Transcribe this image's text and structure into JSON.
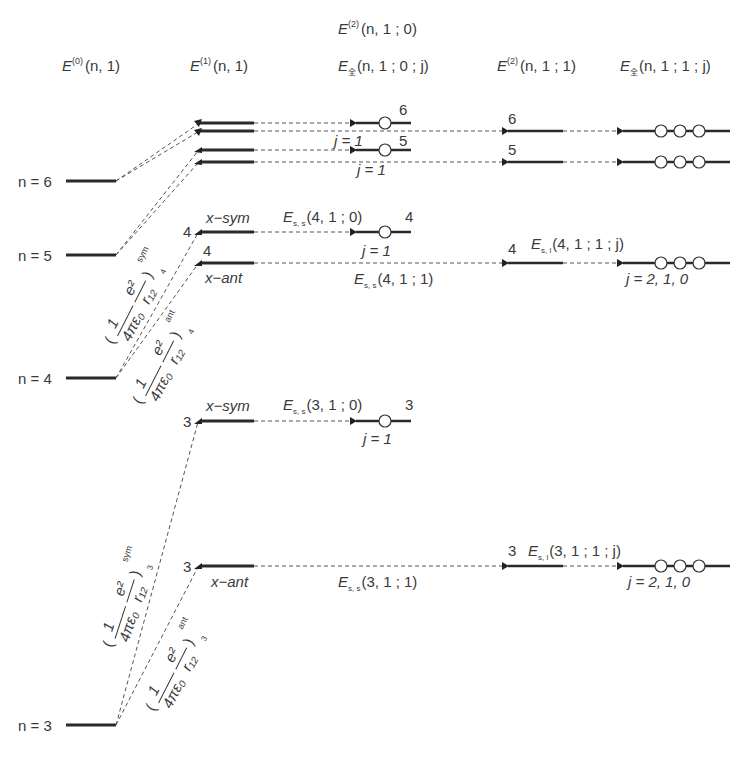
{
  "column_headers": {
    "col0": {
      "base": "E",
      "sup": "(0)",
      "args": "(n, 1)"
    },
    "col1": {
      "base": "E",
      "sup": "(1)",
      "args": "(n, 1)"
    },
    "col2_top": {
      "base": "E",
      "sup": "(2)",
      "args": "(n, 1 ; 0)"
    },
    "col2": {
      "base": "E",
      "sub": "全",
      "args": "(n, 1 ; 0 ; j)"
    },
    "col3": {
      "base": "E",
      "sup": "(2)",
      "args": "(n, 1 ; 1)"
    },
    "col4": {
      "base": "E",
      "sub": "全",
      "args": "(n, 1 ; 1 ; j)"
    }
  },
  "unperturbed_levels": [
    {
      "label": "n = 6",
      "n": 6
    },
    {
      "label": "n = 5",
      "n": 5
    },
    {
      "label": "n = 4",
      "n": 4
    },
    {
      "label": "n = 3",
      "n": 3
    }
  ],
  "first_order_labels": {
    "x_sym": "x−sym",
    "x_ant": "x−ant",
    "n4_sym": "4",
    "n4_ant": "4",
    "n3_sym": "3",
    "n3_ant": "3"
  },
  "coulomb_terms": {
    "prefix": "1",
    "denominator": "4πε₀",
    "numerator": "e²",
    "r": "r₁₂",
    "n4_sym": {
      "sup": "sym",
      "sub": "4"
    },
    "n4_ant": {
      "sup": "ant",
      "sub": "4"
    },
    "n3_sym": {
      "sup": "sym",
      "sub": "3"
    },
    "n3_ant": {
      "sup": "ant",
      "sub": "3"
    }
  },
  "second_order_j0": {
    "n6": {
      "num": "6",
      "j": "j = 1"
    },
    "n5": {
      "num": "5",
      "j": "j = 1"
    },
    "n4": {
      "num": "4",
      "j": "j = 1",
      "term": "E",
      "term_sub": "s, s",
      "term_args": "(4, 1 ; 0)"
    },
    "n3": {
      "num": "3",
      "j": "j = 1",
      "term": "E",
      "term_sub": "s, s",
      "term_args": "(3, 1 ; 0)"
    }
  },
  "ss_terms_j1": {
    "n4": {
      "term": "E",
      "term_sub": "s, s",
      "term_args": "(4, 1 ; 1)"
    },
    "n3": {
      "term": "E",
      "term_sub": "s, s",
      "term_args": "(3, 1 ; 1)"
    }
  },
  "second_order_j1": {
    "n6": {
      "num": "6"
    },
    "n5": {
      "num": "5"
    },
    "n4": {
      "num": "4",
      "term": "E",
      "term_sub": "s, l",
      "term_args": "(4, 1 ; 1 ; j)",
      "j": "j = 2, 1, 0"
    },
    "n3": {
      "num": "3",
      "term": "E",
      "term_sub": "s, l",
      "term_args": "(3, 1 ; 1 ; j)",
      "j": "j = 2, 1, 0"
    }
  },
  "colors": {
    "line": "#2a2a2a",
    "text": "#3a3a3a",
    "dash": "#555555",
    "background": "#ffffff"
  }
}
